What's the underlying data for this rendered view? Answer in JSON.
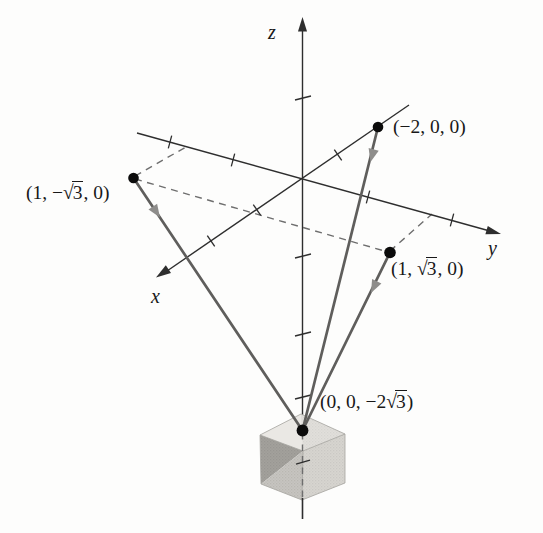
{
  "figure": {
    "radical_sign": "√",
    "axes": {
      "x": {
        "label": "x"
      },
      "y": {
        "label": "y"
      },
      "z": {
        "label": "z"
      }
    },
    "points": [
      {
        "id": "p-minus2-0-0",
        "coords": [
          "-2",
          "0",
          "0"
        ],
        "label": {
          "pre": "(−2, 0, 0)",
          "radicand": "",
          "post": ""
        }
      },
      {
        "id": "p-1-minus-sqrt3-0",
        "coords": [
          "1",
          "−√3",
          "0"
        ],
        "label": {
          "pre": "(1, −",
          "radicand": "3",
          "post": ", 0)"
        }
      },
      {
        "id": "p-1-sqrt3-0",
        "coords": [
          "1",
          "√3",
          "0"
        ],
        "label": {
          "pre": "(1, ",
          "radicand": "3",
          "post": ", 0)"
        }
      },
      {
        "id": "p-0-0-minus2sqrt3",
        "coords": [
          "0",
          "0",
          "−2√3"
        ],
        "label": {
          "pre": "(0, 0, −2",
          "radicand": "3",
          "post": ")"
        }
      }
    ],
    "colors": {
      "background": "#fdfdfc",
      "axis": "#2e2e2e",
      "wire": "#5f5e5c",
      "wire_arrow": "#8e8d8b",
      "dashed_guide": "#6e6e6e",
      "point_dot": "#0b0b0b",
      "text": "#181818",
      "cube_top": "#eae8e4",
      "cube_left_dark": "#a3a19c",
      "cube_left_light": "#c7c5c0",
      "cube_right": "#d7d5d0"
    }
  }
}
